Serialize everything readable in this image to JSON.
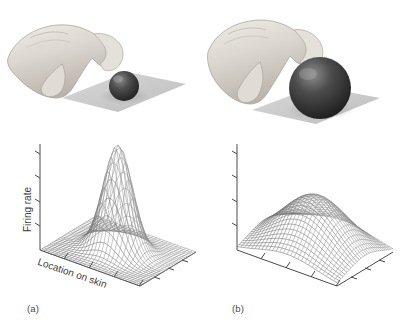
{
  "figure": {
    "background_color": "#ffffff",
    "ink_color": "#3b3b3b",
    "mesh_color": "#7d7d7d",
    "panels": [
      {
        "id": "a",
        "caption": "(a)",
        "photo": {
          "description": "hand grasping small sphere on flat plane",
          "sphere_size": "small",
          "sphere_color": "#3a3a3a",
          "plane_color": "#c9c9c9",
          "hand_color": "#d8d4cf"
        },
        "axes": {
          "ylabel": "Firing rate",
          "xlabel": "Location on skin",
          "y_ticks": 4,
          "x_ticks": 4,
          "z_ticks": 3,
          "grid": false
        }
      },
      {
        "id": "b",
        "caption": "(b)",
        "photo": {
          "description": "hand grasping large sphere on flat plane",
          "sphere_size": "large",
          "sphere_color": "#3a3a3a",
          "plane_color": "#c9c9c9",
          "hand_color": "#d8d4cf"
        },
        "axes": {
          "ylabel": "",
          "xlabel": "",
          "y_ticks": 4,
          "x_ticks": 4,
          "z_ticks": 3,
          "grid": false
        }
      }
    ]
  },
  "chart_data": [
    {
      "type": "surface",
      "panel": "a",
      "title": "",
      "xlabel": "Location on skin",
      "ylabel": "Firing rate",
      "zlabel": "Location on skin",
      "projection": "3d-wireframe",
      "grid": false,
      "legend": null,
      "xlim": [
        0,
        1
      ],
      "ylim": [
        0,
        1
      ],
      "zlim": [
        0,
        1
      ],
      "surface_model": "gaussian",
      "amplitude": 1.0,
      "center": [
        0.5,
        0.5
      ],
      "sigma_x": 0.13,
      "sigma_y": 0.13,
      "mesh_n": 28,
      "annotation": "sharp narrow peak - small object stimulates a small skin region"
    },
    {
      "type": "surface",
      "panel": "b",
      "title": "",
      "xlabel": "",
      "ylabel": "",
      "zlabel": "",
      "projection": "3d-wireframe",
      "grid": false,
      "legend": null,
      "xlim": [
        0,
        1
      ],
      "ylim": [
        0,
        1
      ],
      "zlim": [
        0,
        1
      ],
      "surface_model": "gaussian",
      "amplitude": 0.52,
      "center": [
        0.5,
        0.5
      ],
      "sigma_x": 0.3,
      "sigma_y": 0.3,
      "mesh_n": 28,
      "annotation": "broad low peak - large object stimulates a wide skin region"
    }
  ]
}
